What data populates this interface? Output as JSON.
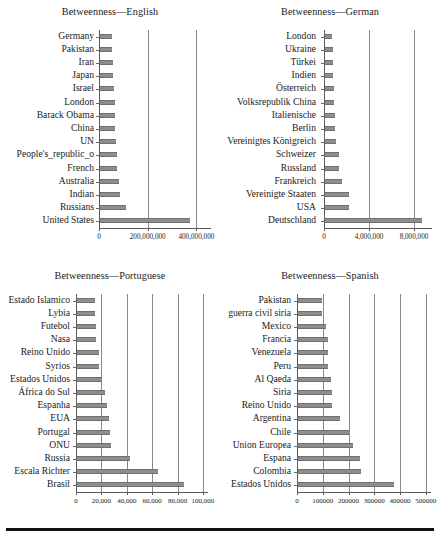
{
  "figure": {
    "panels": [
      {
        "id": "english",
        "title": "Betweenness—English",
        "xticks": [
          "0",
          "200,000,000",
          "400,000,000"
        ],
        "xtickvals": [
          0,
          200000000,
          400000000
        ],
        "categories": [
          "Germany",
          "Pakistan",
          "Iran",
          "Japan",
          "Israel",
          "London",
          "Barack Obama",
          "China",
          "UN",
          "People's_republic_o",
          "French",
          "Australia",
          "Indian",
          "Russians",
          "United States"
        ],
        "values": [
          48000000,
          50000000,
          52000000,
          55000000,
          56000000,
          60000000,
          62000000,
          63000000,
          64000000,
          70000000,
          70000000,
          76000000,
          82000000,
          105000000,
          370000000
        ],
        "xmax": 460000000
      },
      {
        "id": "german",
        "title": "Betweenness—German",
        "xticks": [
          "0",
          "4,000,000",
          "8,000,000"
        ],
        "xtickvals": [
          0,
          4000000,
          8000000
        ],
        "categories": [
          "London",
          "Ukraine",
          "Türkei",
          "Indien",
          "Österreich",
          "Volksrepublik China",
          "Italienische",
          "Berlin",
          "Vereinigtes Königreich",
          "Schweizer",
          "Russland",
          "Frankreich",
          "Vereinigte Staaten",
          "USA",
          "Deutschland"
        ],
        "values": [
          620000,
          680000,
          700000,
          740000,
          790000,
          820000,
          880000,
          900000,
          1000000,
          1200000,
          1250000,
          1500000,
          2100000,
          2120000,
          8600000
        ],
        "xmax": 9600000
      },
      {
        "id": "portuguese",
        "title": "Betweenness—Portuguese",
        "xticks": [
          "0",
          "20,000",
          "40,000",
          "60,000",
          "80,000",
          "100,000"
        ],
        "xtickvals": [
          0,
          20000,
          40000,
          60000,
          80000,
          100000
        ],
        "categories": [
          "Estado Islamico",
          "Lybia",
          "Futebol",
          "Nasa",
          "Reino Unido",
          "Syrios",
          "Estados Unidos",
          "África do Sul",
          "Espanha",
          "EUA",
          "Portugal",
          "ONU",
          "Russia",
          "Escala Richter",
          "Brasil"
        ],
        "values": [
          14500,
          14500,
          15000,
          14800,
          17500,
          17500,
          20000,
          22000,
          23500,
          25500,
          26000,
          26500,
          41500,
          63500,
          84000
        ],
        "xmax": 104000
      },
      {
        "id": "spanish",
        "title": "Betweenness—Spanish",
        "xticks": [
          "0",
          "100000",
          "200000",
          "300000",
          "400000",
          "500000"
        ],
        "xtickvals": [
          0,
          100000,
          200000,
          300000,
          400000,
          500000
        ],
        "categories": [
          "Pakistan",
          "guerra civil siria",
          "Mexico",
          "Francia",
          "Venezuela",
          "Peru",
          "Al Qaeda",
          "Siria",
          "Reino Unido",
          "Argentina",
          "Chile",
          "Union Europea",
          "Espana",
          "Colombia",
          "Estados Unidos"
        ],
        "values": [
          95000,
          95000,
          107000,
          117000,
          115000,
          115000,
          128000,
          130000,
          132000,
          163000,
          198000,
          213000,
          240000,
          243000,
          374000
        ],
        "xmax": 520000
      }
    ]
  },
  "chart_data": [
    {
      "type": "bar",
      "title": "Betweenness—English",
      "orientation": "horizontal",
      "xlabel": "",
      "ylabel": "",
      "grid": true,
      "legend": "none",
      "categories": [
        "Germany",
        "Pakistan",
        "Iran",
        "Japan",
        "Israel",
        "London",
        "Barack Obama",
        "China",
        "UN",
        "People's_republic_o",
        "French",
        "Australia",
        "Indian",
        "Russians",
        "United States"
      ],
      "values": [
        48000000,
        50000000,
        52000000,
        55000000,
        56000000,
        60000000,
        62000000,
        63000000,
        64000000,
        70000000,
        70000000,
        76000000,
        82000000,
        105000000,
        370000000
      ],
      "xlim": [
        0,
        460000000
      ],
      "xticks": [
        0,
        200000000,
        400000000
      ],
      "xticklabels": [
        "0",
        "200,000,000",
        "400,000,000"
      ]
    },
    {
      "type": "bar",
      "title": "Betweenness—German",
      "orientation": "horizontal",
      "xlabel": "",
      "ylabel": "",
      "grid": true,
      "legend": "none",
      "categories": [
        "London",
        "Ukraine",
        "Türkei",
        "Indien",
        "Österreich",
        "Volksrepublik China",
        "Italienische",
        "Berlin",
        "Vereinigtes Königreich",
        "Schweizer",
        "Russland",
        "Frankreich",
        "Vereinigte Staaten",
        "USA",
        "Deutschland"
      ],
      "values": [
        620000,
        680000,
        700000,
        740000,
        790000,
        820000,
        880000,
        900000,
        1000000,
        1200000,
        1250000,
        1500000,
        2100000,
        2120000,
        8600000
      ],
      "xlim": [
        0,
        9600000
      ],
      "xticks": [
        0,
        4000000,
        8000000
      ],
      "xticklabels": [
        "0",
        "4,000,000",
        "8,000,000"
      ]
    },
    {
      "type": "bar",
      "title": "Betweenness—Portuguese",
      "orientation": "horizontal",
      "xlabel": "",
      "ylabel": "",
      "grid": true,
      "legend": "none",
      "categories": [
        "Estado Islamico",
        "Lybia",
        "Futebol",
        "Nasa",
        "Reino Unido",
        "Syrios",
        "Estados Unidos",
        "África do Sul",
        "Espanha",
        "EUA",
        "Portugal",
        "ONU",
        "Russia",
        "Escala Richter",
        "Brasil"
      ],
      "values": [
        14500,
        14500,
        15000,
        14800,
        17500,
        17500,
        20000,
        22000,
        23500,
        25500,
        26000,
        26500,
        41500,
        63500,
        84000
      ],
      "xlim": [
        0,
        104000
      ],
      "xticks": [
        0,
        20000,
        40000,
        60000,
        80000,
        100000
      ],
      "xticklabels": [
        "0",
        "20,000",
        "40,000",
        "60,000",
        "80,000",
        "100,000"
      ]
    },
    {
      "type": "bar",
      "title": "Betweenness—Spanish",
      "orientation": "horizontal",
      "xlabel": "",
      "ylabel": "",
      "grid": true,
      "legend": "none",
      "categories": [
        "Pakistan",
        "guerra civil siria",
        "Mexico",
        "Francia",
        "Venezuela",
        "Peru",
        "Al Qaeda",
        "Siria",
        "Reino Unido",
        "Argentina",
        "Chile",
        "Union Europea",
        "Espana",
        "Colombia",
        "Estados Unidos"
      ],
      "values": [
        95000,
        95000,
        107000,
        117000,
        115000,
        115000,
        128000,
        130000,
        132000,
        163000,
        198000,
        213000,
        240000,
        243000,
        374000
      ],
      "xlim": [
        0,
        520000
      ],
      "xticks": [
        0,
        100000,
        200000,
        300000,
        400000,
        500000
      ],
      "xticklabels": [
        "0",
        "100000",
        "200000",
        "300000",
        "400000",
        "500000"
      ]
    }
  ],
  "style": {
    "bar_color": "#8e8e8e",
    "grid_color": "#8a8a8a",
    "axis_color": "#5a5a5a",
    "text_color": "#1a1a1a"
  }
}
